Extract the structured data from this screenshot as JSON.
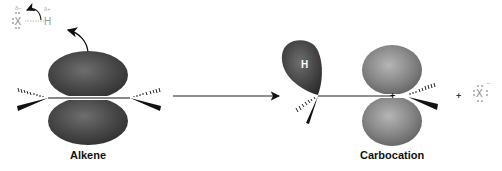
{
  "diagram": {
    "reactant_label": "Alkene",
    "product_label": "Carbocation",
    "hx_molecule": {
      "x_atom": "X",
      "h_atom": "H",
      "delta_minus": "δ−",
      "delta_plus": "δ+"
    },
    "hydrogen_lobe_label": "H",
    "byproduct": {
      "plus_sign": "+",
      "atom": "X",
      "charge": "−"
    },
    "carbocation_charge": "+",
    "colors": {
      "lobe_dark": "#3c3c3c",
      "lobe_mid": "#6a6a6a",
      "lobe_light": "#9a9a9a",
      "line": "#111111",
      "faint_text": "#9a9a9a"
    }
  }
}
